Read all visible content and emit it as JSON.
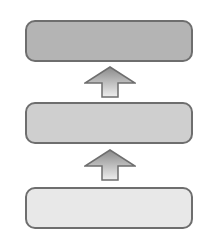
{
  "diagram": {
    "type": "layered-stack",
    "direction": "bottom-to-top",
    "layers": [
      {
        "label": "",
        "fill": "#b4b4b4",
        "top": 20
      },
      {
        "label": "",
        "fill": "#cfcfcf",
        "top": 102
      },
      {
        "label": "",
        "fill": "#e8e8e8",
        "top": 187
      }
    ],
    "arrows": [
      {
        "from": 1,
        "to": 0,
        "top": 66
      },
      {
        "from": 2,
        "to": 1,
        "top": 149
      }
    ],
    "colors": {
      "border": "#6e6e6e",
      "arrow_top": "#8a8a8a",
      "arrow_bottom": "#eeeeee"
    }
  }
}
